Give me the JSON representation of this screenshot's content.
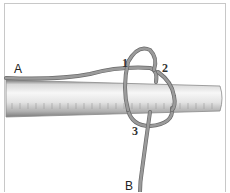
{
  "diagram": {
    "type": "knot-illustration",
    "labels": {
      "end_a": "A",
      "end_b": "B",
      "crossing_1": "1",
      "crossing_2": "2",
      "crossing_3": "3"
    },
    "colors": {
      "rope": "#8e8e8e",
      "rope_outline": "#6a6a6a",
      "pole_light": "#f2f2f2",
      "pole_dark": "#9a9a9a",
      "frame_border": "#c8c8c8",
      "label_text": "#222222"
    }
  }
}
